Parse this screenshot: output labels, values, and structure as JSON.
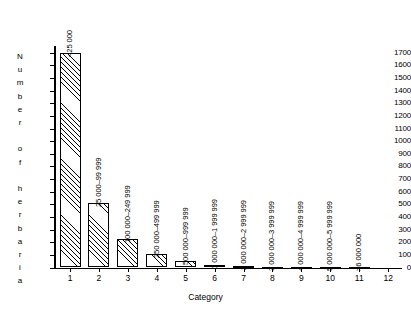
{
  "chart_data": {
    "type": "bar",
    "title": "",
    "xlabel": "Category",
    "ylabel": "Number of herbaria",
    "categories": [
      "1",
      "2",
      "3",
      "4",
      "5",
      "6",
      "7",
      "8",
      "9",
      "10",
      "11",
      "12"
    ],
    "values": [
      1700,
      510,
      225,
      105,
      50,
      18,
      10,
      5,
      3,
      5,
      2,
      0
    ],
    "bar_labels": [
      "<25 000",
      "25 000–99 999",
      "100 000–249 999",
      "250 000–499 999",
      "500 000–999 999",
      "1 000 000–1 999 999",
      "2 000 000–2 999 999",
      "3 000 000–3 999 999",
      "4 000 000–4 999 999",
      "5 000 000–5 999 999",
      ">6 000 000",
      ""
    ],
    "ylim": [
      0,
      1750
    ],
    "ytick_labels": [
      "0",
      "100",
      "200",
      "300",
      "400",
      "500",
      "600",
      "700",
      "800",
      "900",
      "1000",
      "1100",
      "1200",
      "1300",
      "1400",
      "1500",
      "1600",
      "1700"
    ],
    "ytick_values": [
      0,
      100,
      200,
      300,
      400,
      500,
      600,
      700,
      800,
      900,
      1000,
      1100,
      1200,
      1300,
      1400,
      1500,
      1600,
      1700
    ],
    "grid": false,
    "legend": false,
    "bar_fill": "diagonal-hatch",
    "line_color": "#000000",
    "background": "#ffffff"
  },
  "axis": {
    "y_title_letters": [
      "N",
      "u",
      "m",
      "b",
      "e",
      "r",
      "",
      "o",
      "f",
      "",
      "h",
      "e",
      "r",
      "b",
      "a",
      "r",
      "i",
      "a"
    ],
    "x_title": "Category"
  }
}
